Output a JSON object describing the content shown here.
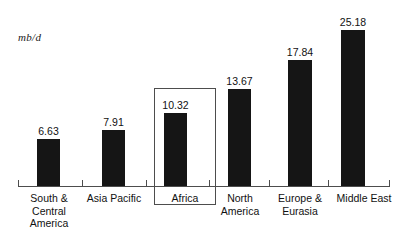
{
  "chart_data": {
    "type": "bar",
    "title": "",
    "subtitle": "",
    "xlabel": "",
    "ylabel": "mb/d",
    "units_label": "mb/d",
    "grid": false,
    "legend": "none",
    "ylim": [
      0,
      28
    ],
    "categories": [
      "South &\nCentral\nAmerica",
      "Asia Pacific",
      "Africa",
      "North\nAmerica",
      "Europe &\nEurasia",
      "Middle East"
    ],
    "values": [
      6.63,
      7.91,
      10.32,
      13.67,
      17.84,
      25.18
    ],
    "value_labels": [
      "6.63",
      "7.91",
      "10.32",
      "13.67",
      "17.84",
      "25.18"
    ],
    "highlighted_category": "Africa",
    "bar_color": "#151515",
    "axis_color": "#4d4d4d",
    "text_color": "#111111",
    "background": "#ffffff"
  },
  "bars": [
    {
      "label": "South &\nCentral\nAmerica",
      "value_label": "6.63",
      "left": 37,
      "width": 23,
      "height": 47,
      "label_left": 18,
      "label_width": 62
    },
    {
      "label": "Asia Pacific",
      "value_label": "7.91",
      "left": 102,
      "width": 23,
      "height": 56,
      "label_left": 83,
      "label_width": 62
    },
    {
      "label": "Africa",
      "value_label": "10.32",
      "left": 164,
      "width": 23,
      "height": 73,
      "label_left": 154,
      "label_width": 62
    },
    {
      "label": "North\nAmerica",
      "value_label": "13.67",
      "left": 228,
      "width": 23,
      "height": 97,
      "label_left": 209,
      "label_width": 62
    },
    {
      "label": "Europe &\nEurasia",
      "value_label": "17.84",
      "left": 288,
      "width": 24,
      "height": 126,
      "label_left": 269,
      "label_width": 62
    },
    {
      "label": "Middle East",
      "value_label": "25.18",
      "left": 341,
      "width": 24,
      "height": 156,
      "label_left": 331,
      "label_width": 66
    }
  ],
  "ticks": [
    18,
    82,
    146,
    209,
    269,
    328,
    389
  ]
}
